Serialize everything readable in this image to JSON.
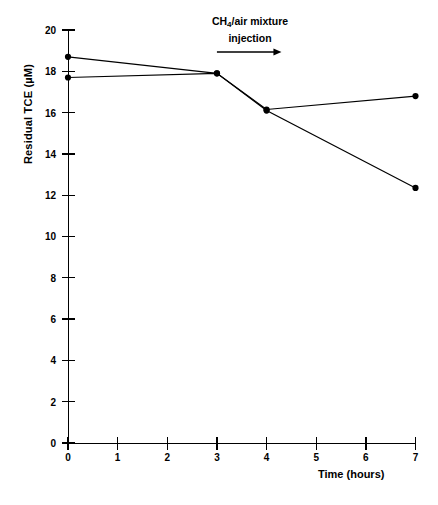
{
  "chart_data": {
    "type": "line",
    "title": "",
    "xlabel": "Time  (hours)",
    "ylabel": "Residual TCE (µM)",
    "xlim": [
      0,
      7
    ],
    "ylim": [
      0,
      20
    ],
    "xticks": [
      0,
      1,
      2,
      3,
      4,
      5,
      6,
      7
    ],
    "yticks": [
      0,
      2,
      4,
      6,
      8,
      10,
      12,
      14,
      16,
      18,
      20
    ],
    "grid": false,
    "legend": "none",
    "annotations": [
      {
        "name": "injection-annotation",
        "text_line1": "CH4/air mixture",
        "text_line2": "injection",
        "formula_prefix": "CH",
        "formula_sub": "4",
        "formula_suffix": "/air  mixture",
        "arrow": "right-arrow",
        "x_start": 3.0,
        "x_end": 4.3
      }
    ],
    "series": [
      {
        "name": "series-upper",
        "marker": "filled-circle",
        "x": [
          0,
          3,
          4,
          7
        ],
        "values": [
          18.7,
          17.9,
          16.15,
          16.8
        ]
      },
      {
        "name": "series-lower",
        "marker": "filled-circle",
        "x": [
          0,
          3,
          4,
          7
        ],
        "values": [
          17.7,
          17.9,
          16.1,
          12.35
        ]
      }
    ]
  },
  "axes": {
    "y_tick_labels": [
      "0",
      "2",
      "4",
      "6",
      "8",
      "10",
      "12",
      "14",
      "16",
      "18",
      "20"
    ],
    "x_tick_labels": [
      "0",
      "1",
      "2",
      "3",
      "4",
      "5",
      "6",
      "7"
    ],
    "y_title": "Residual TCE (µM)",
    "x_title": "Time  (hours)"
  },
  "colors": {
    "line": "#000000",
    "marker": "#000000",
    "axis": "#000000",
    "background": "#ffffff"
  }
}
